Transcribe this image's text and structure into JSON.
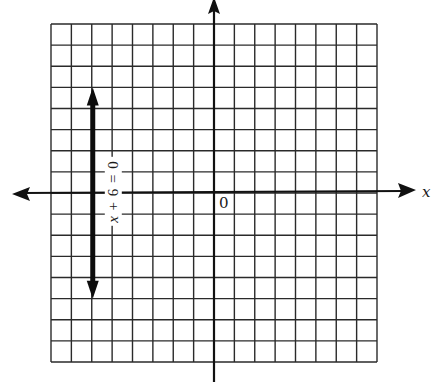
{
  "diagram": {
    "type": "coordinate-graph",
    "grid": {
      "cols": 16,
      "rows": 16,
      "x_range": [
        -8,
        8
      ],
      "y_range": [
        -8,
        8
      ]
    },
    "axes": {
      "x_label": "x",
      "y_label": "y",
      "origin_label": "0"
    },
    "line": {
      "equation": "x + 6 = 0",
      "equation_parts": {
        "var": "x",
        "rest": " + 6 = 0"
      },
      "x": -6,
      "y_from": -5,
      "y_to": 5,
      "arrows": "both"
    },
    "colors": {
      "ink": "#1a1a1a",
      "grid": "#2a2a2a",
      "background": "#ffffff"
    }
  }
}
